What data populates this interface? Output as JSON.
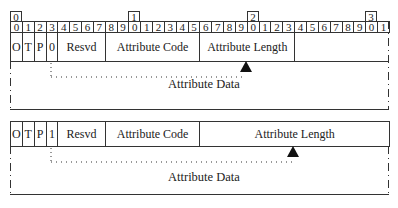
{
  "ruler": {
    "tens": [
      {
        "bit": 0,
        "label": "0"
      },
      {
        "bit": 10,
        "label": "1"
      },
      {
        "bit": 20,
        "label": "2"
      },
      {
        "bit": 30,
        "label": "3"
      }
    ],
    "units": [
      "0",
      "1",
      "2",
      "3",
      "4",
      "5",
      "6",
      "7",
      "8",
      "9",
      "0",
      "1",
      "2",
      "3",
      "4",
      "5",
      "6",
      "7",
      "8",
      "9",
      "0",
      "1",
      "2",
      "3",
      "4",
      "5",
      "6",
      "7",
      "8",
      "9",
      "0",
      "1"
    ]
  },
  "format_short": {
    "fields": [
      {
        "label": "O",
        "start": 0,
        "end": 1
      },
      {
        "label": "T",
        "start": 1,
        "end": 2
      },
      {
        "label": "P",
        "start": 2,
        "end": 3
      },
      {
        "label": "0",
        "start": 3,
        "end": 4
      },
      {
        "label": "Resvd",
        "start": 4,
        "end": 8
      },
      {
        "label": "Attribute Code",
        "start": 8,
        "end": 16
      },
      {
        "label": "Attribute Length",
        "start": 16,
        "end": 24
      }
    ],
    "data_label": "Attribute Data"
  },
  "format_extended": {
    "fields": [
      {
        "label": "O",
        "start": 0,
        "end": 1
      },
      {
        "label": "T",
        "start": 1,
        "end": 2
      },
      {
        "label": "P",
        "start": 2,
        "end": 3
      },
      {
        "label": "1",
        "start": 3,
        "end": 4
      },
      {
        "label": "Resvd",
        "start": 4,
        "end": 8
      },
      {
        "label": "Attribute Code",
        "start": 8,
        "end": 16
      },
      {
        "label": "Attribute Length",
        "start": 16,
        "end": 32
      }
    ],
    "data_label": "Attribute Data"
  }
}
